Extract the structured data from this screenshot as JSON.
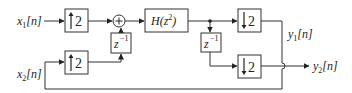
{
  "diagram": {
    "type": "block-diagram",
    "inputs": [
      {
        "id": "x1",
        "label_base": "x",
        "label_sub": "1",
        "label_tail": "[n]"
      },
      {
        "id": "x2",
        "label_base": "x",
        "label_sub": "2",
        "label_tail": "[n]"
      }
    ],
    "outputs": [
      {
        "id": "y1",
        "label_base": "y",
        "label_sub": "1",
        "label_tail": "[n]"
      },
      {
        "id": "y2",
        "label_base": "y",
        "label_sub": "2",
        "label_tail": "[n]"
      }
    ],
    "blocks": {
      "upsampler_top": {
        "symbol": "↑",
        "factor": "2"
      },
      "upsampler_bottom": {
        "symbol": "↑",
        "factor": "2"
      },
      "delay_left": {
        "base": "z",
        "exp": "−1"
      },
      "adder": {
        "symbol": "+"
      },
      "filter": {
        "label": "H(z",
        "exp": "2",
        "close": ")"
      },
      "delay_right": {
        "base": "z",
        "exp": "−1"
      },
      "downsampler_top": {
        "symbol": "↓",
        "factor": "2"
      },
      "downsampler_bottom": {
        "symbol": "↓",
        "factor": "2"
      }
    },
    "connections": [
      "x1 -> upsampler_top -> adder",
      "x2 -> upsampler_bottom -> delay_left -> adder",
      "adder -> filter -> junction",
      "junction -> downsampler_top -> y1",
      "junction -> delay_right -> downsampler_bottom -> y2",
      "y1 path -> bottom line -> x2 input"
    ]
  }
}
